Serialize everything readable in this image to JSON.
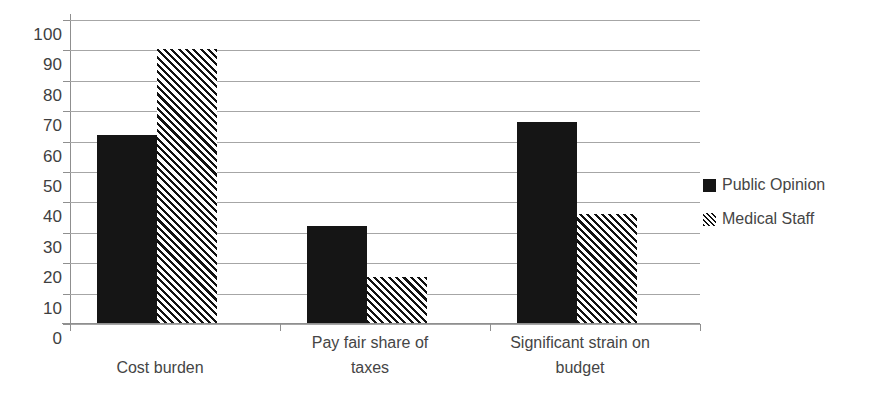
{
  "chart_data": {
    "type": "bar",
    "title": "",
    "subtitle": "",
    "xlabel": "",
    "ylabel": "",
    "ylim": [
      0,
      100
    ],
    "y_ticks": [
      0,
      10,
      20,
      30,
      40,
      50,
      60,
      70,
      80,
      90,
      100
    ],
    "grid": true,
    "legend_position": "right",
    "categories": [
      "Cost burden",
      "Pay fair share of taxes",
      "Significant strain on budget"
    ],
    "category_lines": [
      [
        "Cost burden"
      ],
      [
        "Pay fair share of",
        "taxes"
      ],
      [
        "Significant strain on",
        "budget"
      ]
    ],
    "series": [
      {
        "name": "Public Opinion",
        "fill": "solid",
        "color": "#151515",
        "values": [
          62,
          32,
          66
        ]
      },
      {
        "name": "Medical Staff",
        "fill": "hatch",
        "color": "#151515",
        "values": [
          90,
          15,
          36
        ]
      }
    ]
  },
  "legend": {
    "items": [
      {
        "label": "Public Opinion",
        "swatch": "solid-square-marker"
      },
      {
        "label": "Medical Staff",
        "swatch": "hatched-square-marker"
      }
    ]
  },
  "axis": {
    "y_tick_labels": [
      "100",
      "90",
      "80",
      "70",
      "60",
      "50",
      "40",
      "30",
      "20",
      "10",
      "0"
    ]
  },
  "colors": {
    "series_solid": "#151515",
    "series_hatch": "#111111",
    "gridline": "#a6a6a6",
    "axis": "#8f8f8f",
    "text": "#454545",
    "background": "#ffffff"
  }
}
